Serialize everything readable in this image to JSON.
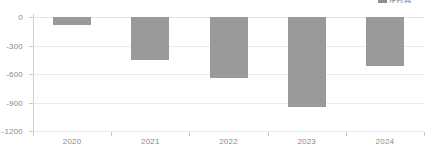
{
  "legend": {
    "swatch_color": "#8f8f8f",
    "label": "净利润"
  },
  "chart_data": {
    "type": "bar",
    "title": "",
    "subtitle": "",
    "xlabel": "",
    "ylabel": "",
    "categories": [
      "2020",
      "2021",
      "2022",
      "2023",
      "2024"
    ],
    "values": [
      -85,
      -450,
      -640,
      -945,
      -515
    ],
    "series": [
      {
        "name": "净利润",
        "color": "#9a9a9a",
        "values": [
          -85,
          -450,
          -640,
          -945,
          -515
        ]
      }
    ],
    "ylim": [
      -1200,
      0
    ],
    "yticks": [
      0,
      -300,
      -600,
      -900,
      -1200
    ],
    "ytick_labels": [
      "0",
      "-300",
      "-600",
      "-900",
      "-1200"
    ],
    "grid": true,
    "grid_axis": "y",
    "legend_position": "top-right",
    "bar_color": "#9a9a9a",
    "gridline_color": "#ebebeb",
    "axis_color": "#c9c9c9",
    "label_color": "#8a8a8a",
    "annotations": []
  }
}
